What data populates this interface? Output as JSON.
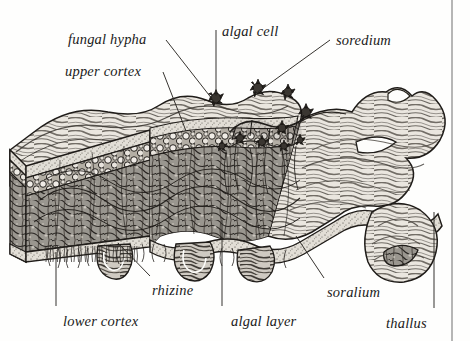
{
  "figure": {
    "style": "engraving",
    "background_color": "#fefefd",
    "ink_color": "#1a1a1a",
    "border": {
      "visible": true,
      "color": "#6f6f6f",
      "sides": [
        "right"
      ],
      "x": 452
    },
    "width": 470,
    "height": 341
  },
  "labels": [
    {
      "id": "fungal-hypha",
      "text": "fungal hypha",
      "x": 68,
      "y": 32,
      "anchor": "start"
    },
    {
      "id": "algal-cell",
      "text": "algal cell",
      "x": 222,
      "y": 24,
      "anchor": "start"
    },
    {
      "id": "soredium",
      "text": "soredium",
      "x": 336,
      "y": 33,
      "anchor": "start"
    },
    {
      "id": "upper-cortex",
      "text": "upper cortex",
      "x": 65,
      "y": 64,
      "anchor": "start"
    },
    {
      "id": "rhizine",
      "text": "rhizine",
      "x": 152,
      "y": 283,
      "anchor": "start"
    },
    {
      "id": "soralium",
      "text": "soralium",
      "x": 327,
      "y": 285,
      "anchor": "start"
    },
    {
      "id": "lower-cortex",
      "text": "lower cortex",
      "x": 63,
      "y": 314,
      "anchor": "start"
    },
    {
      "id": "algal-layer",
      "text": "algal layer",
      "x": 231,
      "y": 314,
      "anchor": "start"
    },
    {
      "id": "thallus",
      "text": "thallus",
      "x": 386,
      "y": 316,
      "anchor": "start"
    }
  ],
  "leader_lines": [
    {
      "id": "leader-fungal-hypha",
      "from": [
        166,
        40
      ],
      "to": [
        216,
        104
      ],
      "kind": "diagonal"
    },
    {
      "id": "leader-algal-cell",
      "from": [
        216,
        30
      ],
      "to": [
        216,
        96
      ],
      "kind": "vertical"
    },
    {
      "id": "leader-soredium",
      "from": [
        330,
        40
      ],
      "to": [
        258,
        92
      ],
      "kind": "diagonal"
    },
    {
      "id": "leader-upper-cortex",
      "from": [
        163,
        72
      ],
      "to": [
        186,
        131
      ],
      "kind": "diagonal"
    },
    {
      "id": "leader-rhizine",
      "from": [
        150,
        276
      ],
      "to": [
        118,
        243
      ],
      "kind": "diagonal"
    },
    {
      "id": "leader-soralium",
      "from": [
        324,
        278
      ],
      "to": [
        296,
        236
      ],
      "kind": "diagonal"
    },
    {
      "id": "leader-lower-cortex",
      "from": [
        56,
        306
      ],
      "to": [
        56,
        252
      ],
      "kind": "vertical"
    },
    {
      "id": "leader-algal-layer",
      "from": [
        222,
        306
      ],
      "to": [
        222,
        220
      ],
      "kind": "vertical"
    },
    {
      "id": "leader-thallus",
      "from": [
        434,
        308
      ],
      "to": [
        434,
        212
      ],
      "kind": "vertical"
    }
  ],
  "structures": [
    {
      "id": "thallus-body",
      "name": "thallus",
      "description": "lobed flattened lichen body, cut away at left"
    },
    {
      "id": "upper-cortex",
      "name": "upper cortex",
      "description": "dense protective fungal layer on upper surface"
    },
    {
      "id": "algal-layer",
      "name": "algal layer",
      "description": "band of rounded photobiont cells beneath the upper cortex"
    },
    {
      "id": "medulla",
      "name": "medulla",
      "description": "loose mesh of fungal hyphae filling the interior"
    },
    {
      "id": "lower-cortex",
      "name": "lower cortex",
      "description": "dense fungal layer on the underside"
    },
    {
      "id": "rhizines",
      "name": "rhizine",
      "description": "root-like hyphal tufts anchoring the thallus"
    },
    {
      "id": "soralium",
      "name": "soralium",
      "description": "rupture in the upper cortex releasing soredia"
    },
    {
      "id": "soredia",
      "name": "soredium",
      "description": "propagule of algal cells wrapped in fungal hyphae"
    }
  ]
}
